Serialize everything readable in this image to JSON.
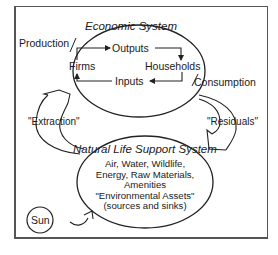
{
  "diagram": {
    "economic_system": {
      "title": "Economic System",
      "nodes": {
        "outputs": "Outputs",
        "firms": "Firms",
        "households": "Households",
        "inputs": "Inputs"
      }
    },
    "side_labels": {
      "production": "Production",
      "consumption": "Consumption"
    },
    "flows": {
      "extraction": "\"Extraction\"",
      "residuals": "\"Residuals\""
    },
    "natural_system": {
      "title": "Natural Life Support System",
      "lines": [
        "Air, Water, Wildlife,",
        "Energy, Raw Materials,",
        "Amenities",
        "\"Environmental Assets\"",
        "(sources and sinks)"
      ]
    },
    "sun": "Sun"
  }
}
